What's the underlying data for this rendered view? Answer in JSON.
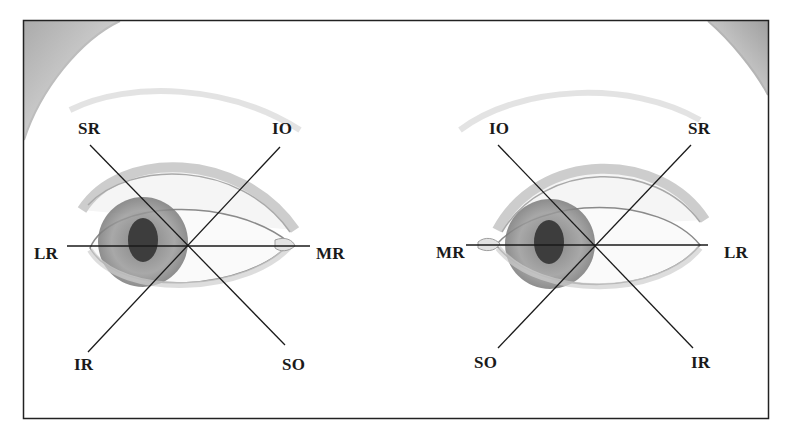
{
  "figure": {
    "frame_color": "#222222",
    "line_color": "#1a1a1a"
  },
  "eyes": [
    {
      "side": "left-image-eye",
      "center": [
        186,
        246
      ],
      "labels": {
        "top_left": "SR",
        "top_right": "IO",
        "left": "LR",
        "right": "MR",
        "bottom_left": "IR",
        "bottom_right": "SO"
      }
    },
    {
      "side": "right-image-eye",
      "center": [
        595,
        245
      ],
      "labels": {
        "top_left": "IO",
        "top_right": "SR",
        "left": "MR",
        "right": "LR",
        "bottom_left": "SO",
        "bottom_right": "IR"
      }
    }
  ]
}
